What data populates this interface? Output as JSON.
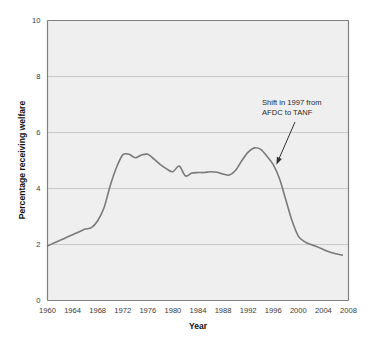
{
  "chart_data": {
    "type": "line",
    "title": "",
    "xlabel": "Year",
    "ylabel": "Percentage receiving welfare",
    "xlim": [
      1960,
      2008
    ],
    "ylim": [
      0,
      10
    ],
    "grid": true,
    "legend": "none",
    "xticks": [
      1960,
      1964,
      1968,
      1972,
      1976,
      1980,
      1984,
      1988,
      1992,
      1996,
      2000,
      2004,
      2008
    ],
    "xtick_labels": [
      "1960",
      "1964",
      "1968",
      "1972",
      "1976",
      "1980",
      "1984",
      "1988",
      "1992",
      "1996",
      "2000",
      "2004",
      "2008"
    ],
    "yticks": [
      0,
      2,
      4,
      6,
      8,
      10
    ],
    "ytick_labels": [
      "0",
      "2",
      "4",
      "6",
      "8",
      "10"
    ],
    "series": [
      {
        "name": "Percentage receiving welfare",
        "color": "#7a7a7a",
        "x": [
          1960,
          1961,
          1962,
          1963,
          1964,
          1965,
          1966,
          1967,
          1968,
          1969,
          1970,
          1971,
          1972,
          1973,
          1974,
          1975,
          1976,
          1977,
          1978,
          1979,
          1980,
          1981,
          1982,
          1983,
          1984,
          1985,
          1986,
          1987,
          1988,
          1989,
          1990,
          1991,
          1992,
          1993,
          1994,
          1995,
          1996,
          1997,
          1998,
          1999,
          2000,
          2001,
          2002,
          2003,
          2004,
          2005,
          2006,
          2007
        ],
        "y": [
          1.95,
          2.05,
          2.15,
          2.25,
          2.35,
          2.45,
          2.55,
          2.6,
          2.85,
          3.3,
          4.1,
          4.75,
          5.2,
          5.22,
          5.1,
          5.2,
          5.22,
          5.05,
          4.85,
          4.7,
          4.6,
          4.8,
          4.45,
          4.55,
          4.57,
          4.57,
          4.6,
          4.58,
          4.52,
          4.48,
          4.65,
          5.0,
          5.3,
          5.45,
          5.4,
          5.15,
          4.85,
          4.35,
          3.6,
          2.85,
          2.3,
          2.1,
          2.0,
          1.92,
          1.82,
          1.73,
          1.67,
          1.62
        ]
      }
    ],
    "annotations": [
      {
        "name": "welfare-reform-annotation",
        "line1": "Shift in 1997 from",
        "line2": "AFDC to TANF",
        "target_x": 1996.5,
        "target_y": 4.85
      }
    ],
    "colors": {
      "plot_background": "#efefef",
      "gridline": "#c9c9c9",
      "axis": "#808080",
      "line": "#7a7a7a",
      "text": "#2b2b2b",
      "annotation_arrow": "#333333"
    }
  }
}
